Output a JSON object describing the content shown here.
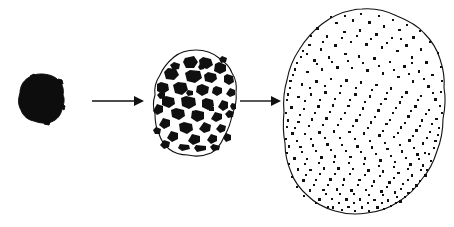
{
  "figure": {
    "background_color": "#ffffff",
    "ink_color": "#101010",
    "width": 454,
    "height": 227,
    "stage_count": 3,
    "arrow_count": 2
  },
  "stages": [
    {
      "id": "stage-1",
      "name": "solid-black-blob",
      "description": "Small solid black irregular round blob",
      "fill_style": "solid",
      "center": [
        41,
        98
      ],
      "radius_x": 22,
      "radius_y": 24,
      "inclusion_count": 0,
      "color": "#0d0d0d"
    },
    {
      "id": "stage-2",
      "name": "coarse-speckled-blob",
      "description": "Medium outlined blob filled with large angular black patches",
      "fill_style": "coarse-patches",
      "center": [
        195,
        103
      ],
      "radius_x": 42,
      "radius_y": 54,
      "inclusion_count": 42,
      "color": "#101010",
      "outline_color": "#111111"
    },
    {
      "id": "stage-3",
      "name": "fine-speckled-blob",
      "description": "Large outlined blob filled with many small scattered specks",
      "fill_style": "fine-specks",
      "center": [
        364,
        112
      ],
      "radius_x": 81,
      "radius_y": 104,
      "inclusion_count": 300,
      "color": "#101010",
      "outline_color": "#111111"
    }
  ],
  "arrows": [
    {
      "id": "arrow-1",
      "name": "arrow-stage1-to-stage2",
      "from_stage": "stage-1",
      "to_stage": "stage-2",
      "x1": 92,
      "y1": 101,
      "x2": 144,
      "y2": 101,
      "direction": "right",
      "label": ""
    },
    {
      "id": "arrow-2",
      "name": "arrow-stage2-to-stage3",
      "from_stage": "stage-2",
      "to_stage": "stage-3",
      "x1": 240,
      "y1": 101,
      "x2": 281,
      "y2": 101,
      "direction": "right",
      "label": ""
    }
  ]
}
